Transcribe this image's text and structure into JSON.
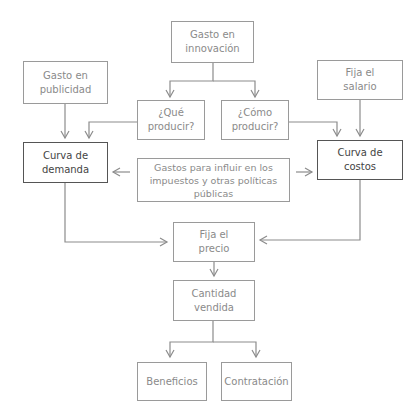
{
  "diagram": {
    "nodes": {
      "innovacion": {
        "line1": "Gasto en",
        "line2": "innovación"
      },
      "publicidad": {
        "line1": "Gasto en",
        "line2": "publicidad"
      },
      "salario": {
        "line1": "Fija el",
        "line2": "salario"
      },
      "que_producir": {
        "line1": "¿Qué",
        "line2": "producir?"
      },
      "como_producir": {
        "line1": "¿Cómo",
        "line2": "producir?"
      },
      "curva_demanda": {
        "line1": "Curva de",
        "line2": "demanda"
      },
      "curva_costos": {
        "line1": "Curva de",
        "line2": "costos"
      },
      "gastos_politicas": {
        "line1": "Gastos para influir en los",
        "line2": "impuestos y otras políticas",
        "line3": "públicas"
      },
      "precio": {
        "line1": "Fija el",
        "line2": "precio"
      },
      "cantidad": {
        "line1": "Cantidad",
        "line2": "vendida"
      },
      "beneficios": {
        "line1": "Beneficios"
      },
      "contratacion": {
        "line1": "Contratación"
      }
    },
    "edges": [
      [
        "innovacion",
        "que_producir"
      ],
      [
        "innovacion",
        "como_producir"
      ],
      [
        "publicidad",
        "curva_demanda"
      ],
      [
        "que_producir",
        "curva_demanda"
      ],
      [
        "salario",
        "curva_costos"
      ],
      [
        "como_producir",
        "curva_costos"
      ],
      [
        "gastos_politicas",
        "curva_demanda"
      ],
      [
        "gastos_politicas",
        "curva_costos"
      ],
      [
        "curva_demanda",
        "precio"
      ],
      [
        "curva_costos",
        "precio"
      ],
      [
        "precio",
        "cantidad"
      ],
      [
        "cantidad",
        "beneficios"
      ],
      [
        "cantidad",
        "contratacion"
      ]
    ],
    "colors": {
      "line": "#8c8c8c",
      "border_light": "#9a9a9a",
      "border_strong": "#555555"
    }
  }
}
